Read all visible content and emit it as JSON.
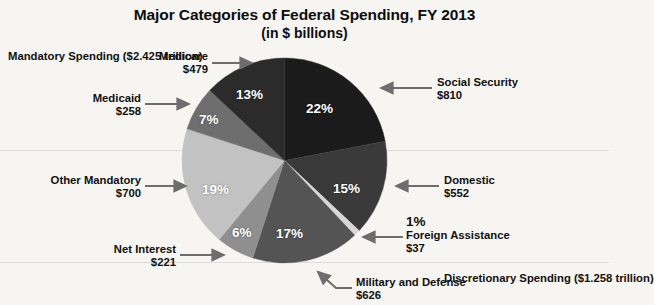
{
  "chart_data": {
    "type": "pie",
    "title": "Major Categories of Federal Spending, FY 2013",
    "subtitle": "(in $ billions)",
    "units": "billions of dollars",
    "categories": [
      "Social Security",
      "Domestic",
      "Foreign Assistance",
      "Military and Defense",
      "Net Interest",
      "Other Mandatory",
      "Medicaid",
      "Medicare"
    ],
    "values": [
      810,
      552,
      37,
      626,
      221,
      700,
      258,
      479
    ],
    "percentages": [
      22,
      15,
      1,
      17,
      6,
      19,
      7,
      13
    ],
    "pct_labels": [
      "22%",
      "15%",
      "1%",
      "17%",
      "6%",
      "19%",
      "7%",
      "13%"
    ],
    "value_labels": [
      "$810",
      "$552",
      "$37",
      "$626",
      "$221",
      "$700",
      "$258",
      "$479"
    ],
    "slice_colors": [
      "#1b1b1b",
      "#3a3a3a",
      "#d8d8d8",
      "#545454",
      "#8f8f8f",
      "#c2c2c2",
      "#6e6e6e",
      "#2b2b2b"
    ],
    "start_angle_deg": 0,
    "direction": "clockwise",
    "legend": "none",
    "grid": false,
    "groups": [
      {
        "name": "Mandatory Spending",
        "amount": "($2.425 trillion)"
      },
      {
        "name": "Discretionary Spending",
        "amount": "($1.258 trillion)"
      }
    ]
  },
  "title": {
    "line1": "Major Categories of Federal Spending, FY 2013",
    "line2": "(in $ billions)"
  },
  "labels": {
    "mandatory_name": "Mandatory Spending",
    "mandatory_amount": "($2.425 trillion)",
    "discretionary_name": "Discretionary Spending",
    "discretionary_amount": "($1.258 trillion)",
    "medicare_name": "Medicare",
    "medicare_value": "$479",
    "medicaid_name": "Medicaid",
    "medicaid_value": "$258",
    "other_mandatory_name": "Other Mandatory",
    "other_mandatory_value": "$700",
    "net_interest_name": "Net Interest",
    "net_interest_value": "$221",
    "military_name": "Military and Defense",
    "military_value": "$626",
    "foreign_pct": "1%",
    "foreign_name": "Foreign Assistance",
    "foreign_value": "$37",
    "domestic_name": "Domestic",
    "domestic_value": "$552",
    "social_security_name": "Social Security",
    "social_security_value": "$810"
  },
  "slice_pct": {
    "social_security": "22%",
    "domestic": "15%",
    "military": "17%",
    "net_interest": "6%",
    "other_mandatory": "19%",
    "medicaid": "7%",
    "medicare": "13%"
  },
  "colors": {
    "background": "#f6f5f2",
    "text": "#111111",
    "arrow": "#6d6d6d",
    "slice_darkest": "#1b1b1b",
    "slice_lightest": "#d8d8d8"
  }
}
